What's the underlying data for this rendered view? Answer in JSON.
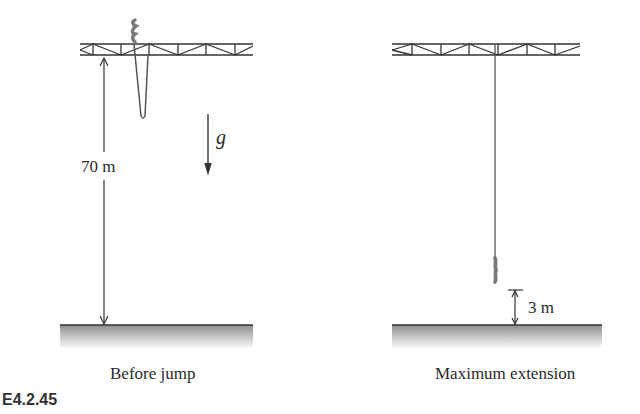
{
  "figure": {
    "id": "E4.2.45",
    "panels": [
      {
        "name": "before-jump",
        "caption": "Before jump",
        "dimension_label": "70 m",
        "gravity_label": "g"
      },
      {
        "name": "maximum-extension",
        "caption": "Maximum extension",
        "dimension_label": "3 m"
      }
    ]
  },
  "colors": {
    "line": "#333333",
    "cord": "#555555",
    "jumper": "#7a7a7a",
    "ground_top": "#8e8e8e",
    "ground_bottom": "#ffffff"
  }
}
